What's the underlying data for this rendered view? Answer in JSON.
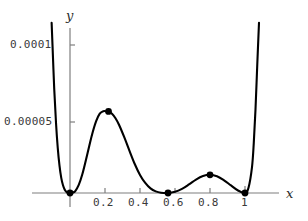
{
  "chart_data": {
    "type": "line",
    "title": "",
    "subtitle": "",
    "xlabel": "x",
    "ylabel": "y",
    "xlim": [
      -0.12,
      1.1
    ],
    "ylim": [
      0,
      0.000115
    ],
    "grid": false,
    "legend": null,
    "x_ticks": [
      {
        "value": 0.2,
        "label": "0.2"
      },
      {
        "value": 0.4,
        "label": "0.4"
      },
      {
        "value": 0.6,
        "label": "0.6"
      },
      {
        "value": 0.8,
        "label": "0.8"
      },
      {
        "value": 1.0,
        "label": "1"
      }
    ],
    "y_ticks": [
      {
        "value": 5e-05,
        "label": "0.00005"
      },
      {
        "value": 0.0001,
        "label": "0.0001"
      }
    ],
    "series": [
      {
        "name": "curve",
        "color": "#000000",
        "x": [
          -0.105,
          -0.1,
          -0.09,
          -0.08,
          -0.07,
          -0.06,
          -0.05,
          -0.04,
          -0.03,
          -0.02,
          -0.01,
          0.0,
          0.01,
          0.02,
          0.03,
          0.05,
          0.07,
          0.09,
          0.11,
          0.13,
          0.15,
          0.17,
          0.19,
          0.21,
          0.22,
          0.24,
          0.26,
          0.28,
          0.31,
          0.34,
          0.37,
          0.4,
          0.43,
          0.46,
          0.49,
          0.52,
          0.56,
          0.6,
          0.64,
          0.68,
          0.72,
          0.76,
          0.8,
          0.84,
          0.88,
          0.92,
          0.96,
          1.0,
          1.02,
          1.04,
          1.05,
          1.06,
          1.07,
          1.08
        ],
        "y": [
          0.000115,
          0.0001,
          7e-05,
          4.75e-05,
          3.05e-05,
          1.85e-05,
          1.02e-05,
          5.2e-06,
          2.2e-06,
          7e-07,
          1e-07,
          0.0,
          1e-07,
          5e-07,
          1.3e-06,
          5.5e-06,
          1.25e-05,
          2.18e-05,
          3.18e-05,
          4.12e-05,
          4.87e-05,
          5.36e-05,
          5.53e-05,
          5.52e-05,
          5.51e-05,
          5.36e-05,
          5.05e-05,
          4.61e-05,
          3.77e-05,
          2.85e-05,
          1.96e-05,
          1.22e-05,
          6.8e-06,
          3.1e-06,
          1.1e-06,
          2e-07,
          0.0,
          8e-07,
          2.8e-06,
          5.8e-06,
          9.1e-06,
          1.15e-05,
          1.23e-05,
          1.13e-05,
          8.6e-06,
          5.1e-06,
          1.7e-06,
          0.0,
          3.5e-06,
          1.75e-05,
          3.35e-05,
          5.65e-05,
          8.65e-05,
          0.000115
        ]
      }
    ],
    "points": [
      {
        "x": 0.0,
        "y": 0.0,
        "label": "minimum-origin"
      },
      {
        "x": 0.22,
        "y": 5.51e-05,
        "label": "local-maximum-left"
      },
      {
        "x": 0.56,
        "y": 0.0,
        "label": "minimum-mid"
      },
      {
        "x": 0.8,
        "y": 1.23e-05,
        "label": "local-maximum-right"
      },
      {
        "x": 1.0,
        "y": 0.0,
        "label": "minimum-right"
      }
    ],
    "point_color": "#000000",
    "axis_color": "#7a7a7a",
    "curve_color": "#000000"
  },
  "axes": {
    "x_name": "x",
    "y_name": "y"
  },
  "ticks": {
    "y": [
      "0.0001",
      "0.00005"
    ],
    "x": [
      "0.2",
      "0.4",
      "0.6",
      "0.8",
      "1"
    ]
  }
}
